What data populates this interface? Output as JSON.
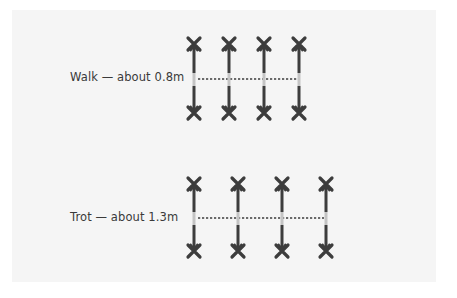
{
  "diagram": {
    "colors": {
      "panel_bg": "#f5f5f5",
      "leg": "#3d3d3d",
      "leg_highlight": "#c4c4c4",
      "stride_line": "#6a6a6a"
    },
    "rows": [
      {
        "gait": "Walk",
        "label": "Walk — about 0.8m",
        "stride": "0.8m",
        "leg_x": [
          194,
          229,
          264,
          299
        ],
        "top_y": 45,
        "bottom_y": 112,
        "mid_y": 79
      },
      {
        "gait": "Trot",
        "label": "Trot — about 1.3m",
        "stride": "1.3m",
        "leg_x": [
          194,
          238,
          282,
          326
        ],
        "top_y": 185,
        "bottom_y": 250,
        "mid_y": 218
      }
    ]
  }
}
